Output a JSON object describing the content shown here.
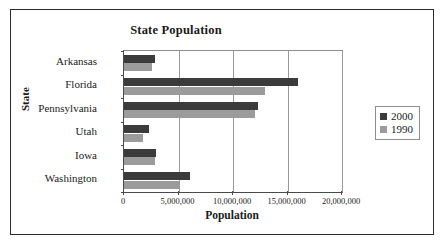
{
  "chart_data": {
    "type": "bar",
    "orientation": "horizontal",
    "title": "State Population",
    "xlabel": "Population",
    "ylabel": "State",
    "categories": [
      "Arkansas",
      "Florida",
      "Pennsylvania",
      "Utah",
      "Iowa",
      "Washington"
    ],
    "series": [
      {
        "name": "2000",
        "color": "#3b3b3b",
        "values": [
          2850000,
          16000000,
          12300000,
          2250000,
          2950000,
          6050000
        ]
      },
      {
        "name": "1990",
        "color": "#9b9b9b",
        "values": [
          2600000,
          12900000,
          12050000,
          1750000,
          2800000,
          5100000
        ]
      }
    ],
    "xlim": [
      0,
      20000000
    ],
    "xticks": [
      0,
      5000000,
      10000000,
      15000000,
      20000000
    ],
    "xtick_labels": [
      "0",
      "5,000,000",
      "10,000,000",
      "15,000,000",
      "20,000,000"
    ],
    "grid": "vertical",
    "legend_position": "right",
    "legend_entries": [
      "2000",
      "1990"
    ]
  },
  "frame": {
    "border_color": "#2b2b2b"
  }
}
